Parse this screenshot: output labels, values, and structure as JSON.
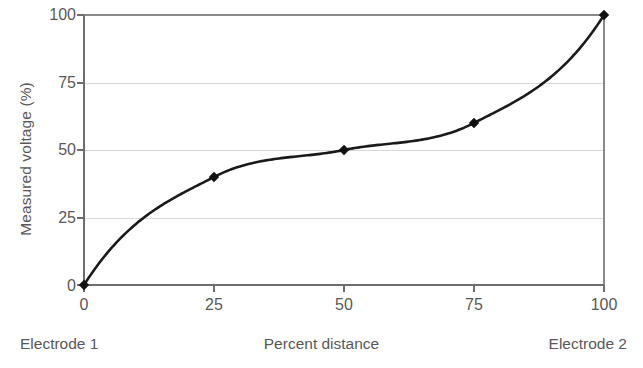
{
  "chart_data": {
    "type": "line",
    "title": "",
    "subtitle": "",
    "xlabel": "Percent distance",
    "ylabel": "Measured voltage (%)",
    "xlim": [
      0,
      100
    ],
    "ylim": [
      0,
      100
    ],
    "grid": true,
    "grid_axis": "y",
    "legend": false,
    "legend_position": "none",
    "x_ticks": [
      0,
      25,
      50,
      75,
      100
    ],
    "y_ticks": [
      0,
      25,
      50,
      75,
      100
    ],
    "x_tick_labels": [
      "0",
      "25",
      "50",
      "75",
      "100"
    ],
    "y_tick_labels": [
      "0",
      "25",
      "50",
      "75",
      "100"
    ],
    "markers": "diamond",
    "series": [
      {
        "name": "Measured voltage",
        "x": [
          0,
          25,
          50,
          75,
          100
        ],
        "values": [
          0,
          40,
          50,
          60,
          100
        ],
        "color": "#1a1a1a"
      }
    ],
    "annotations": [
      {
        "text": "Electrode 1",
        "position": "bottom-left"
      },
      {
        "text": "Percent distance",
        "position": "bottom-center"
      },
      {
        "text": "Electrode 2",
        "position": "bottom-right"
      }
    ],
    "colors": {
      "line": "#1a1a1a",
      "marker": "#111111",
      "axis": "#6e6e70",
      "grid": "#d8d8dc",
      "text": "#58585a",
      "background": "#ffffff"
    }
  },
  "axes": {
    "y_title": "Measured voltage (%)",
    "y_labels": [
      "100",
      "75",
      "50",
      "25",
      "0"
    ],
    "x_labels": [
      "0",
      "25",
      "50",
      "75",
      "100"
    ]
  },
  "captions": {
    "left": "Electrode 1",
    "center": "Percent distance",
    "right": "Electrode 2"
  }
}
